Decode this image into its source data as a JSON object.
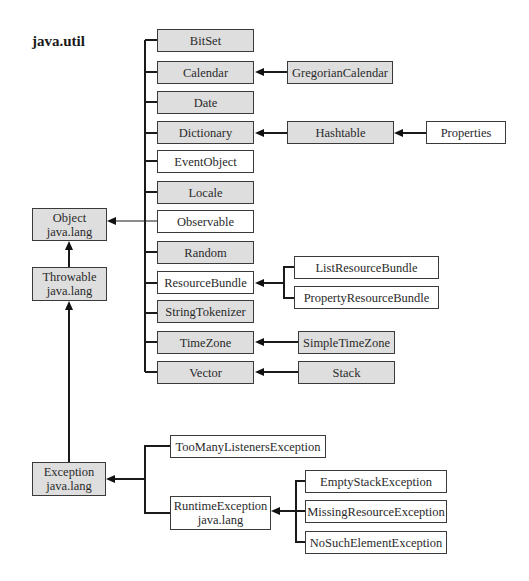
{
  "package_title": "java.util",
  "fill_colors": {
    "gray": "#dedede",
    "white": "#ffffff",
    "line": "#1a1a1a"
  },
  "nodes": {
    "object": {
      "label": "Object",
      "sublabel": "java.lang",
      "fill": "gray"
    },
    "throwable": {
      "label": "Throwable",
      "sublabel": "java.lang",
      "fill": "gray"
    },
    "exception": {
      "label": "Exception",
      "sublabel": "java.lang",
      "fill": "gray"
    },
    "bitset": {
      "label": "BitSet",
      "fill": "gray"
    },
    "calendar": {
      "label": "Calendar",
      "fill": "gray"
    },
    "date": {
      "label": "Date",
      "fill": "gray"
    },
    "dictionary": {
      "label": "Dictionary",
      "fill": "gray"
    },
    "eventobject": {
      "label": "EventObject",
      "fill": "white"
    },
    "locale": {
      "label": "Locale",
      "fill": "gray"
    },
    "observable": {
      "label": "Observable",
      "fill": "white"
    },
    "random": {
      "label": "Random",
      "fill": "gray"
    },
    "resourcebundle": {
      "label": "ResourceBundle",
      "fill": "white"
    },
    "stringtokenizer": {
      "label": "StringTokenizer",
      "fill": "gray"
    },
    "timezone": {
      "label": "TimeZone",
      "fill": "gray"
    },
    "vector": {
      "label": "Vector",
      "fill": "gray"
    },
    "gregoriancalendar": {
      "label": "GregorianCalendar",
      "fill": "gray"
    },
    "hashtable": {
      "label": "Hashtable",
      "fill": "gray"
    },
    "properties": {
      "label": "Properties",
      "fill": "white"
    },
    "listresourcebundle": {
      "label": "ListResourceBundle",
      "fill": "white"
    },
    "propertyresourcebundle": {
      "label": "PropertyResourceBundle",
      "fill": "white"
    },
    "simpletimezone": {
      "label": "SimpleTimeZone",
      "fill": "gray"
    },
    "stack": {
      "label": "Stack",
      "fill": "gray"
    },
    "toomanylistenersexception": {
      "label": "TooManyListenersException",
      "fill": "white"
    },
    "runtimeexception": {
      "label": "RuntimeException",
      "sublabel": "java.lang",
      "fill": "white"
    },
    "emptystackexception": {
      "label": "EmptyStackException",
      "fill": "white"
    },
    "missingresourceexception": {
      "label": "MissingResourceException",
      "fill": "white"
    },
    "nosuchelementexception": {
      "label": "NoSuchElementException",
      "fill": "white"
    }
  },
  "edges": [
    {
      "from": "throwable",
      "to": "object"
    },
    {
      "from": "exception",
      "to": "throwable"
    },
    {
      "from": "bitset",
      "to": "object"
    },
    {
      "from": "calendar",
      "to": "object"
    },
    {
      "from": "date",
      "to": "object"
    },
    {
      "from": "dictionary",
      "to": "object"
    },
    {
      "from": "eventobject",
      "to": "object"
    },
    {
      "from": "locale",
      "to": "object"
    },
    {
      "from": "observable",
      "to": "object"
    },
    {
      "from": "random",
      "to": "object"
    },
    {
      "from": "resourcebundle",
      "to": "object"
    },
    {
      "from": "stringtokenizer",
      "to": "object"
    },
    {
      "from": "timezone",
      "to": "object"
    },
    {
      "from": "vector",
      "to": "object"
    },
    {
      "from": "gregoriancalendar",
      "to": "calendar"
    },
    {
      "from": "hashtable",
      "to": "dictionary"
    },
    {
      "from": "properties",
      "to": "hashtable"
    },
    {
      "from": "listresourcebundle",
      "to": "resourcebundle"
    },
    {
      "from": "propertyresourcebundle",
      "to": "resourcebundle"
    },
    {
      "from": "simpletimezone",
      "to": "timezone"
    },
    {
      "from": "stack",
      "to": "vector"
    },
    {
      "from": "toomanylistenersexception",
      "to": "exception"
    },
    {
      "from": "runtimeexception",
      "to": "exception"
    },
    {
      "from": "emptystackexception",
      "to": "runtimeexception"
    },
    {
      "from": "missingresourceexception",
      "to": "runtimeexception"
    },
    {
      "from": "nosuchelementexception",
      "to": "runtimeexception"
    }
  ]
}
